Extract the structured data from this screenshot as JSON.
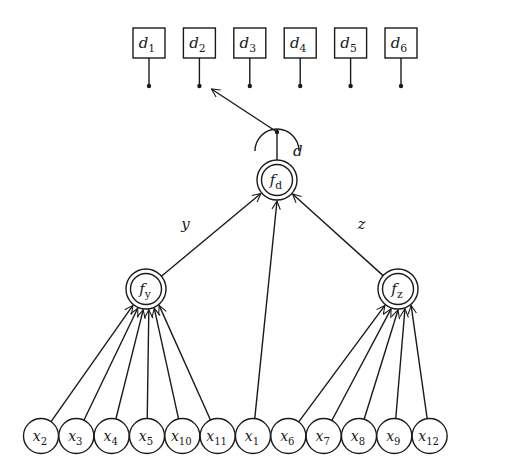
{
  "diagram": {
    "title": "",
    "colors": {
      "ink": "#1a1a1a",
      "background": "#ffffff"
    },
    "decisions": [
      {
        "id": "d1",
        "base": "d",
        "sub": "1"
      },
      {
        "id": "d2",
        "base": "d",
        "sub": "2"
      },
      {
        "id": "d3",
        "base": "d",
        "sub": "3"
      },
      {
        "id": "d4",
        "base": "d",
        "sub": "4"
      },
      {
        "id": "d5",
        "base": "d",
        "sub": "5"
      },
      {
        "id": "d6",
        "base": "d",
        "sub": "6"
      }
    ],
    "selector": {
      "output_label": "d",
      "points_to": "d2"
    },
    "functions": [
      {
        "id": "fd",
        "base": "f",
        "sub": "d",
        "output_label": "d"
      },
      {
        "id": "fy",
        "base": "f",
        "sub": "y",
        "output_label": "y",
        "feeds": "fd"
      },
      {
        "id": "fz",
        "base": "f",
        "sub": "z",
        "output_label": "z",
        "feeds": "fd"
      }
    ],
    "inputs": [
      {
        "id": "x2",
        "base": "x",
        "sub": "2",
        "feeds": "fy"
      },
      {
        "id": "x3",
        "base": "x",
        "sub": "3",
        "feeds": "fy"
      },
      {
        "id": "x4",
        "base": "x",
        "sub": "4",
        "feeds": "fy"
      },
      {
        "id": "x5",
        "base": "x",
        "sub": "5",
        "feeds": "fy"
      },
      {
        "id": "x10",
        "base": "x",
        "sub": "10",
        "feeds": "fy"
      },
      {
        "id": "x11",
        "base": "x",
        "sub": "11",
        "feeds": "fy"
      },
      {
        "id": "x1",
        "base": "x",
        "sub": "1",
        "feeds": "fd"
      },
      {
        "id": "x6",
        "base": "x",
        "sub": "6",
        "feeds": "fz"
      },
      {
        "id": "x7",
        "base": "x",
        "sub": "7",
        "feeds": "fz"
      },
      {
        "id": "x8",
        "base": "x",
        "sub": "8",
        "feeds": "fz"
      },
      {
        "id": "x9",
        "base": "x",
        "sub": "9",
        "feeds": "fz"
      },
      {
        "id": "x12",
        "base": "x",
        "sub": "12",
        "feeds": "fz"
      }
    ]
  }
}
